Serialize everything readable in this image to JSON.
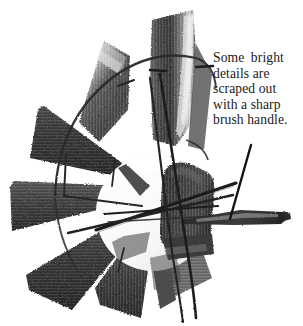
{
  "page": {
    "background_color": "#ffffff",
    "width": 303,
    "height": 326
  },
  "caption": {
    "lines": [
      "Some bright",
      "details are",
      "scraped out",
      "with a sharp",
      "brush handle."
    ],
    "full_text": "Some bright details are scraped out with a sharp brush handle.",
    "color": "#1a1a1a"
  },
  "artwork": {
    "subject": "windmill-fan",
    "medium_note": "grayscale brush painting",
    "palette": {
      "paper": "#ffffff",
      "ink_darkest": "#1c1c1c",
      "blade_dark": "#3a3a3a",
      "blade_mid": "#5a5a5a",
      "blade_light": "#9b9b9b",
      "highlight": "#e6e6e6",
      "hub_light": "#f2f2f2",
      "rod": "#222222",
      "leader_line": "#161616"
    },
    "elements": [
      {
        "name": "hub-disc",
        "kind": "circle",
        "note": "bright scraped hub at center"
      },
      {
        "name": "blade-top",
        "kind": "blade",
        "note": "tall curved blade with bright scraped edge"
      },
      {
        "name": "blade-upper-left",
        "kind": "blade"
      },
      {
        "name": "blade-left-upper",
        "kind": "blade"
      },
      {
        "name": "blade-left-lower",
        "kind": "blade"
      },
      {
        "name": "blade-lower-left",
        "kind": "blade"
      },
      {
        "name": "blade-bottom",
        "kind": "blade"
      },
      {
        "name": "blade-center-right",
        "kind": "blade",
        "note": "dark rounded blade over hub"
      },
      {
        "name": "tail-vane",
        "kind": "blade",
        "note": "tapered horizontal vane to the right"
      },
      {
        "name": "rim-arc",
        "kind": "rod",
        "note": "curved rim support"
      },
      {
        "name": "spoke-rods",
        "kind": "rod",
        "note": "thin scraped rods crossing the hub"
      },
      {
        "name": "leader-line",
        "kind": "annotation",
        "note": "diagonal pointer from caption to vane"
      }
    ]
  }
}
